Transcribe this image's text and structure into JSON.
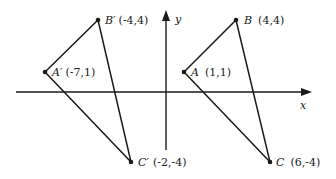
{
  "axes": {
    "x_label": "x",
    "y_label": "y"
  },
  "triangles": [
    {
      "name": "original",
      "points": [
        {
          "id": "A",
          "name": "A",
          "coords": "(1,1)",
          "px": 184,
          "py": 72
        },
        {
          "id": "B",
          "name": "B",
          "coords": "(4,4)",
          "px": 236,
          "py": 20
        },
        {
          "id": "C",
          "name": "C",
          "coords": "(6,-4)",
          "px": 270,
          "py": 162
        }
      ]
    },
    {
      "name": "image",
      "points": [
        {
          "id": "A'",
          "name": "A′",
          "coords": "(-7,1)",
          "px": 45,
          "py": 72
        },
        {
          "id": "B'",
          "name": "B′",
          "coords": "(-4,4)",
          "px": 98,
          "py": 20
        },
        {
          "id": "C'",
          "name": "C′",
          "coords": "(-2,-4)",
          "px": 131,
          "py": 162
        }
      ]
    }
  ],
  "labels": {
    "A": {
      "name": "A",
      "coords": "(1,1)"
    },
    "B": {
      "name": "B",
      "coords": "(4,4)"
    },
    "C": {
      "name": "C",
      "coords": "(6,-4)"
    },
    "A_prime": {
      "name": "A′",
      "coords": "(-7,1)"
    },
    "B_prime": {
      "name": "B′",
      "coords": "(-4,4)"
    },
    "C_prime": {
      "name": "C′",
      "coords": "(-2,-4)"
    }
  },
  "colors": {
    "stroke": "#1a1a1a",
    "background": "#ffffff"
  }
}
